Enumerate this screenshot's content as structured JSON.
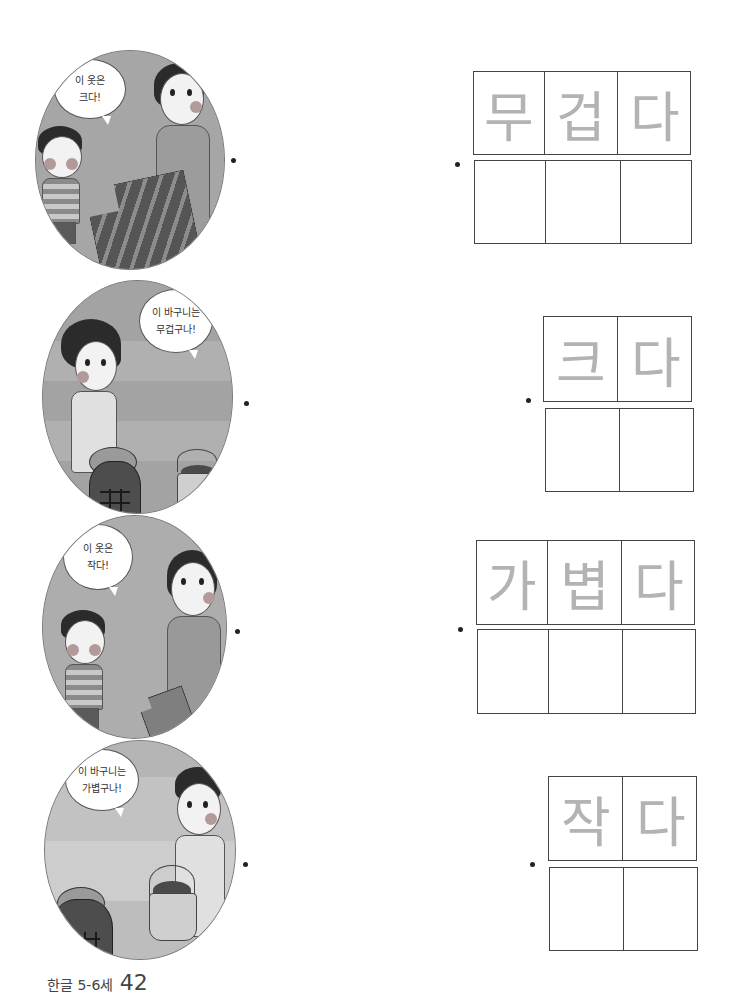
{
  "page": {
    "type": "worksheet",
    "footer": {
      "book_title": "한글 5-6세",
      "page_number": "42"
    }
  },
  "illustrations": [
    {
      "id": 1,
      "scene": "mother holding up a large striped shirt for a boy",
      "speech_line1": "이 옷은",
      "speech_line2": "크다!"
    },
    {
      "id": 2,
      "scene": "girl lifting a heavy sack with a pumpkin, small basket nearby",
      "speech_line1": "이 바구니는",
      "speech_line2": "무겁구나!"
    },
    {
      "id": 3,
      "scene": "mother holding up a small shirt for a boy",
      "speech_line1": "이 옷은",
      "speech_line2": "작다!"
    },
    {
      "id": 4,
      "scene": "girl carrying a light basket, heavy sack nearby",
      "speech_line1": "이 바구니는",
      "speech_line2": "가볍구나!"
    }
  ],
  "word_boxes": [
    {
      "id": 1,
      "word": "무겁다",
      "chars": [
        "무",
        "겁",
        "다"
      ]
    },
    {
      "id": 2,
      "word": "크다",
      "chars": [
        "크",
        "다"
      ]
    },
    {
      "id": 3,
      "word": "가볍다",
      "chars": [
        "가",
        "볍",
        "다"
      ]
    },
    {
      "id": 4,
      "word": "작다",
      "chars": [
        "작",
        "다"
      ]
    }
  ],
  "colors": {
    "trace_text": "#b3b3b3",
    "grid_line": "#444444",
    "illustration_bg": "#a8a8a8"
  }
}
